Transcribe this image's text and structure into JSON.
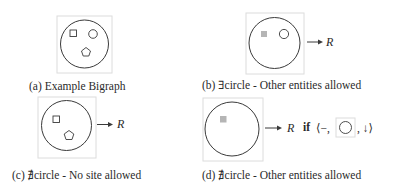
{
  "figure": {
    "panels": [
      {
        "id": "a",
        "caption": "(a) Example Bigraph",
        "entities": [
          "square",
          "circle",
          "pentagon"
        ],
        "arrow_target": null
      },
      {
        "id": "b",
        "caption": "(b) ∃circle - Other entities allowed",
        "entities": [
          "site (gray square)",
          "circle"
        ],
        "arrow_target": "R"
      },
      {
        "id": "c",
        "caption": "(c) ∄circle - No site allowed",
        "entities": [
          "square",
          "pentagon"
        ],
        "arrow_target": "R"
      },
      {
        "id": "d",
        "caption": "(d) ∄circle - Other entities allowed",
        "entities": [
          "site (gray square)"
        ],
        "arrow_target": "R",
        "condition": {
          "keyword": "if",
          "open": "⟨−,",
          "inner_entity": "circle",
          "close": ", ↓⟩"
        }
      }
    ],
    "colors": {
      "stroke": "#3a3a3a",
      "box": "#d9d9d9",
      "site_fill": "#b5b5b5"
    }
  }
}
